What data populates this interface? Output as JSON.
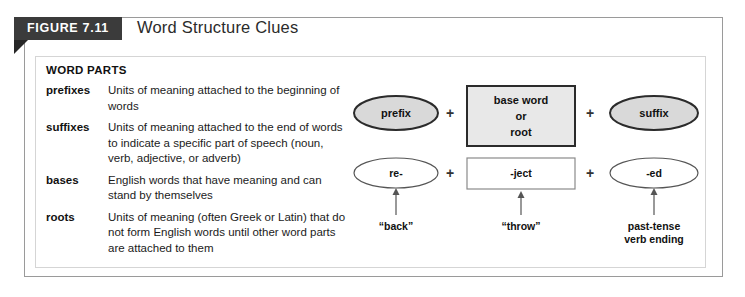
{
  "figure": {
    "tab_label": "FIGURE 7.11",
    "title": "Word Structure Clues"
  },
  "word_parts": {
    "heading": "WORD PARTS",
    "entries": [
      {
        "term": "prefixes",
        "definition": "Units of meaning attached to the beginning of words"
      },
      {
        "term": "suffixes",
        "definition": "Units of meaning attached to the end of words to indicate a specific part of speech (noun, verb, adjective, or adverb)"
      },
      {
        "term": "bases",
        "definition": "English words that have meaning and can stand by themselves"
      },
      {
        "term": "roots",
        "definition": "Units of meaning (often Greek or Latin) that do not form English words until other word parts are attached to them"
      }
    ]
  },
  "diagram": {
    "structure_row": {
      "prefix": "prefix",
      "base": "base word\nor\nroot",
      "base_line1": "base word",
      "base_line2": "or",
      "base_line3": "root",
      "suffix": "suffix",
      "operator_1": "+",
      "operator_2": "+"
    },
    "example_row": {
      "prefix": "re-",
      "base": "-ject",
      "suffix": "-ed",
      "operator_1": "+",
      "operator_2": "+"
    },
    "captions": {
      "prefix_meaning": "“back”",
      "base_meaning": "“throw”",
      "suffix_meaning_line1": "past-tense",
      "suffix_meaning_line2": "verb ending"
    },
    "colors": {
      "shape_fill_gray": "#d9d9d9",
      "shape_fill_white": "#ffffff",
      "shape_stroke_dark": "#2b2b2b",
      "shape_stroke_light": "#8a8a8a"
    }
  }
}
